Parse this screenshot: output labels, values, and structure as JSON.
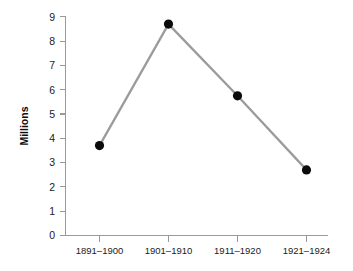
{
  "chart_data": {
    "type": "line",
    "title": "",
    "subtitle": "",
    "xlabel": "",
    "ylabel": "Millions",
    "categories": [
      "1891–1900",
      "1901–1910",
      "1911–1920",
      "1921–1924"
    ],
    "values": [
      3.7,
      8.7,
      5.75,
      2.7
    ],
    "series": [
      {
        "name": "Millions",
        "values": [
          3.7,
          8.7,
          5.75,
          2.7
        ]
      }
    ],
    "ylim": [
      0,
      9
    ],
    "yticks": [
      0,
      1,
      2,
      3,
      4,
      5,
      6,
      7,
      8,
      9
    ],
    "ytick_labels": [
      "0",
      "1",
      "2",
      "3",
      "4",
      "5",
      "6",
      "7",
      "8",
      "9"
    ],
    "grid": false,
    "legend": false,
    "legend_position": "none",
    "marker": "circle",
    "colors": {
      "line": "#9b9b9b",
      "marker": "#0b0b0b",
      "axis": "#9a9a9a",
      "text": "#1a1a1a",
      "background": "#ffffff"
    }
  },
  "axes": {
    "y_title": "Millions",
    "y_tick_0": "0",
    "y_tick_1": "1",
    "y_tick_2": "2",
    "y_tick_3": "3",
    "y_tick_4": "4",
    "y_tick_5": "5",
    "y_tick_6": "6",
    "y_tick_7": "7",
    "y_tick_8": "8",
    "y_tick_9": "9",
    "x_tick_0": "1891–1900",
    "x_tick_1": "1901–1910",
    "x_tick_2": "1911–1920",
    "x_tick_3": "1921–1924"
  }
}
